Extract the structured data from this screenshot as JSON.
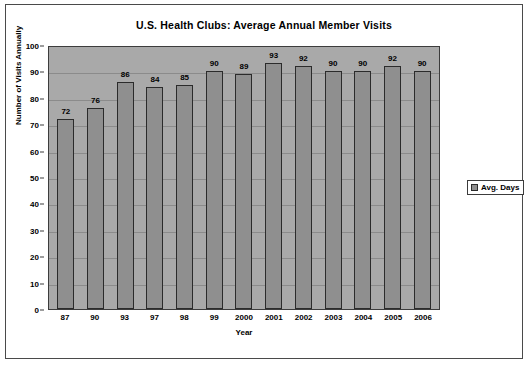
{
  "chart_data": {
    "type": "bar",
    "title": "U.S. Health Clubs: Average Annual Member Visits",
    "xlabel": "Year",
    "ylabel": "Number of Visits Annually",
    "categories": [
      "87",
      "90",
      "93",
      "97",
      "98",
      "99",
      "2000",
      "2001",
      "2002",
      "2003",
      "2004",
      "2005",
      "2006"
    ],
    "values": [
      72,
      76,
      86,
      84,
      85,
      90,
      89,
      93,
      92,
      90,
      90,
      92,
      90
    ],
    "series": [
      {
        "name": "Avg. Days",
        "values": [
          72,
          76,
          86,
          84,
          85,
          90,
          89,
          93,
          92,
          90,
          90,
          92,
          90
        ]
      }
    ],
    "ylim": [
      0,
      100
    ],
    "ytick_step": 10,
    "yticks": [
      "100",
      "90",
      "80",
      "70",
      "60",
      "50",
      "40",
      "30",
      "20",
      "10",
      "0"
    ],
    "grid": true,
    "legend_position": "right",
    "data_labels": true
  },
  "legend": {
    "entries": [
      {
        "label": "Avg. Days",
        "color": "#8f8f8f"
      }
    ]
  },
  "colors": {
    "bar_fill": "#8f8f8f",
    "bar_outline": "#2b2b2b",
    "plot_background": "#a9a9a9",
    "gridline": "#8b8b8b",
    "frame_border": "#4a4a4a",
    "text": "#000000"
  },
  "footer": {
    "text": ""
  }
}
